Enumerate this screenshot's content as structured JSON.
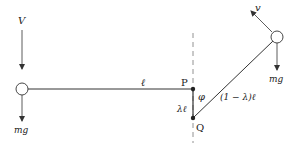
{
  "diagram": {
    "colors": {
      "ink": "#333333",
      "dashed": "#777777",
      "background": "#ffffff"
    },
    "labels": {
      "V": "V",
      "v": "v",
      "mg_left": "mg",
      "mg_right": "mg",
      "ell": "ℓ",
      "P": "P",
      "Q": "Q",
      "phi": "φ",
      "lambda_ell": "λℓ",
      "one_minus_lambda_ell": "(1 − λ)ℓ"
    },
    "points": {
      "left_mass": [
        22,
        89
      ],
      "P": [
        193,
        89
      ],
      "Q": [
        193,
        118
      ],
      "right_mass": [
        277,
        37
      ]
    }
  }
}
